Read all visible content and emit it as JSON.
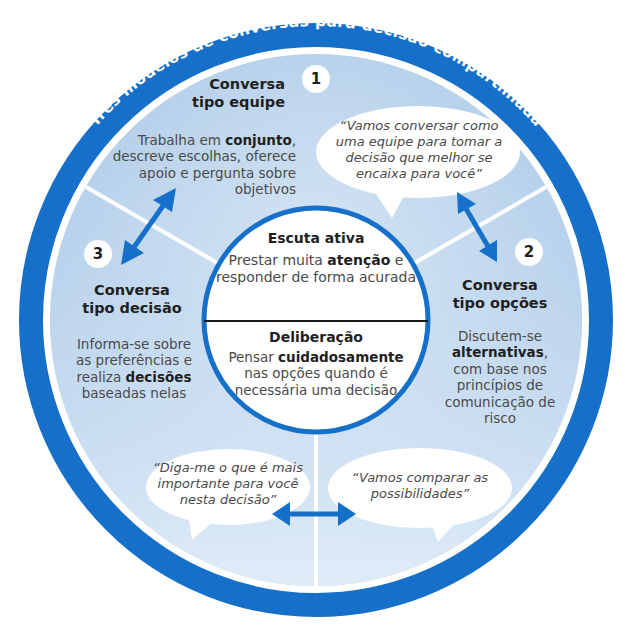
{
  "title": "Três modelos de conversas para decisão compartilhada",
  "colors": {
    "ring": "#1670c9",
    "segment_fill": "#b9d3ec",
    "segment_fill_light": "#d6e6f5",
    "inner_circle": "#ffffff",
    "bubble": "#ffffff",
    "arrow": "#1670c9"
  },
  "sections": {
    "team": {
      "number": "1",
      "title_line1": "Conversa",
      "title_line2": "tipo equipe",
      "body_pre": "Trabalha em ",
      "body_bold": "conjunto",
      "body_post": ", descreve escolhas, oferece apoio e pergunta sobre objetivos",
      "quote": "“Vamos conversar como uma equipe para tomar a decisão que melhor se encaixa para você”"
    },
    "options": {
      "number": "2",
      "title_line1": "Conversa",
      "title_line2": "tipo opções",
      "body_pre": "Discutem-se ",
      "body_bold": "alternativas",
      "body_post": ", com base nos princípios de comunicação de risco",
      "quote": "“Vamos comparar as possibilidades”"
    },
    "decision": {
      "number": "3",
      "title_line1": "Conversa",
      "title_line2": "tipo decisão",
      "body_pre": "Informa-se sobre as preferências e realiza ",
      "body_bold": "decisões",
      "body_post": " baseadas nelas",
      "quote": "“Diga-me o que é mais importante para você nesta decisão”"
    }
  },
  "center": {
    "top_title": "Escuta ativa",
    "top_pre": "Prestar muita ",
    "top_bold": "atenção",
    "top_post": " e responder de forma acurada",
    "bottom_title": "Deliberação",
    "bottom_pre": "Pensar ",
    "bottom_bold": "cuidadosamente",
    "bottom_post": " nas opções quando é necessária uma decisão"
  },
  "icons": [
    "double-arrow-icon-1-3",
    "double-arrow-icon-1-2",
    "double-arrow-icon-3-2"
  ]
}
